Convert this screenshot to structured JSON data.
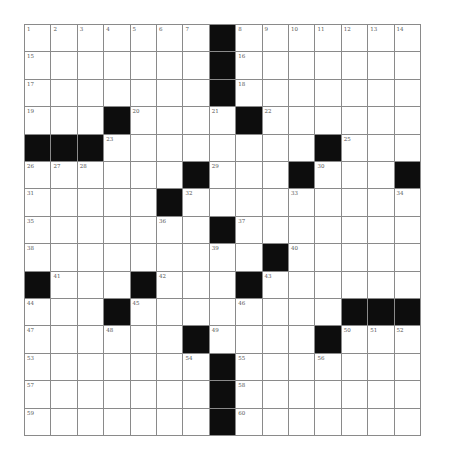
{
  "puzzle": {
    "rows": 15,
    "cols": 15,
    "colors": {
      "block": "#0d0d0d",
      "cell": "#ffffff",
      "line": "#8a8a8a",
      "number": "#555555"
    },
    "blocks": [
      [
        0,
        7
      ],
      [
        1,
        7
      ],
      [
        2,
        7
      ],
      [
        3,
        3
      ],
      [
        3,
        8
      ],
      [
        4,
        0
      ],
      [
        4,
        1
      ],
      [
        4,
        2
      ],
      [
        4,
        11
      ],
      [
        5,
        6
      ],
      [
        5,
        10
      ],
      [
        5,
        14
      ],
      [
        6,
        5
      ],
      [
        7,
        7
      ],
      [
        8,
        9
      ],
      [
        9,
        0
      ],
      [
        9,
        4
      ],
      [
        9,
        8
      ],
      [
        10,
        3
      ],
      [
        10,
        12
      ],
      [
        10,
        13
      ],
      [
        10,
        14
      ],
      [
        11,
        6
      ],
      [
        11,
        11
      ],
      [
        12,
        7
      ],
      [
        13,
        7
      ],
      [
        14,
        7
      ]
    ],
    "numbers": [
      {
        "r": 0,
        "c": 0,
        "n": "1"
      },
      {
        "r": 0,
        "c": 1,
        "n": "2"
      },
      {
        "r": 0,
        "c": 2,
        "n": "3"
      },
      {
        "r": 0,
        "c": 3,
        "n": "4"
      },
      {
        "r": 0,
        "c": 4,
        "n": "5"
      },
      {
        "r": 0,
        "c": 5,
        "n": "6"
      },
      {
        "r": 0,
        "c": 6,
        "n": "7"
      },
      {
        "r": 0,
        "c": 8,
        "n": "8"
      },
      {
        "r": 0,
        "c": 9,
        "n": "9"
      },
      {
        "r": 0,
        "c": 10,
        "n": "10"
      },
      {
        "r": 0,
        "c": 11,
        "n": "11"
      },
      {
        "r": 0,
        "c": 12,
        "n": "12"
      },
      {
        "r": 0,
        "c": 13,
        "n": "13"
      },
      {
        "r": 0,
        "c": 14,
        "n": "14"
      },
      {
        "r": 1,
        "c": 0,
        "n": "15"
      },
      {
        "r": 1,
        "c": 8,
        "n": "16"
      },
      {
        "r": 2,
        "c": 0,
        "n": "17"
      },
      {
        "r": 2,
        "c": 8,
        "n": "18"
      },
      {
        "r": 3,
        "c": 0,
        "n": "19"
      },
      {
        "r": 3,
        "c": 4,
        "n": "20"
      },
      {
        "r": 3,
        "c": 7,
        "n": "21"
      },
      {
        "r": 3,
        "c": 9,
        "n": "22"
      },
      {
        "r": 4,
        "c": 3,
        "n": "23"
      },
      {
        "r": 4,
        "c": 12,
        "n": "25"
      },
      {
        "r": 5,
        "c": 0,
        "n": "26"
      },
      {
        "r": 5,
        "c": 1,
        "n": "27"
      },
      {
        "r": 5,
        "c": 2,
        "n": "28"
      },
      {
        "r": 5,
        "c": 7,
        "n": "29"
      },
      {
        "r": 5,
        "c": 11,
        "n": "30"
      },
      {
        "r": 6,
        "c": 0,
        "n": "31"
      },
      {
        "r": 6,
        "c": 6,
        "n": "32"
      },
      {
        "r": 6,
        "c": 10,
        "n": "33"
      },
      {
        "r": 6,
        "c": 14,
        "n": "34"
      },
      {
        "r": 7,
        "c": 0,
        "n": "35"
      },
      {
        "r": 7,
        "c": 5,
        "n": "36"
      },
      {
        "r": 7,
        "c": 8,
        "n": "37"
      },
      {
        "r": 8,
        "c": 0,
        "n": "38"
      },
      {
        "r": 8,
        "c": 7,
        "n": "39"
      },
      {
        "r": 8,
        "c": 10,
        "n": "40"
      },
      {
        "r": 9,
        "c": 1,
        "n": "41"
      },
      {
        "r": 9,
        "c": 5,
        "n": "42"
      },
      {
        "r": 9,
        "c": 9,
        "n": "43"
      },
      {
        "r": 10,
        "c": 0,
        "n": "44"
      },
      {
        "r": 10,
        "c": 4,
        "n": "45"
      },
      {
        "r": 10,
        "c": 8,
        "n": "46"
      },
      {
        "r": 11,
        "c": 0,
        "n": "47"
      },
      {
        "r": 11,
        "c": 3,
        "n": "48"
      },
      {
        "r": 11,
        "c": 7,
        "n": "49"
      },
      {
        "r": 11,
        "c": 12,
        "n": "50"
      },
      {
        "r": 11,
        "c": 13,
        "n": "51"
      },
      {
        "r": 11,
        "c": 14,
        "n": "52"
      },
      {
        "r": 12,
        "c": 0,
        "n": "53"
      },
      {
        "r": 12,
        "c": 6,
        "n": "54"
      },
      {
        "r": 12,
        "c": 8,
        "n": "55"
      },
      {
        "r": 12,
        "c": 11,
        "n": "56"
      },
      {
        "r": 13,
        "c": 0,
        "n": "57"
      },
      {
        "r": 13,
        "c": 8,
        "n": "58"
      },
      {
        "r": 14,
        "c": 0,
        "n": "59"
      },
      {
        "r": 14,
        "c": 8,
        "n": "60"
      }
    ]
  }
}
